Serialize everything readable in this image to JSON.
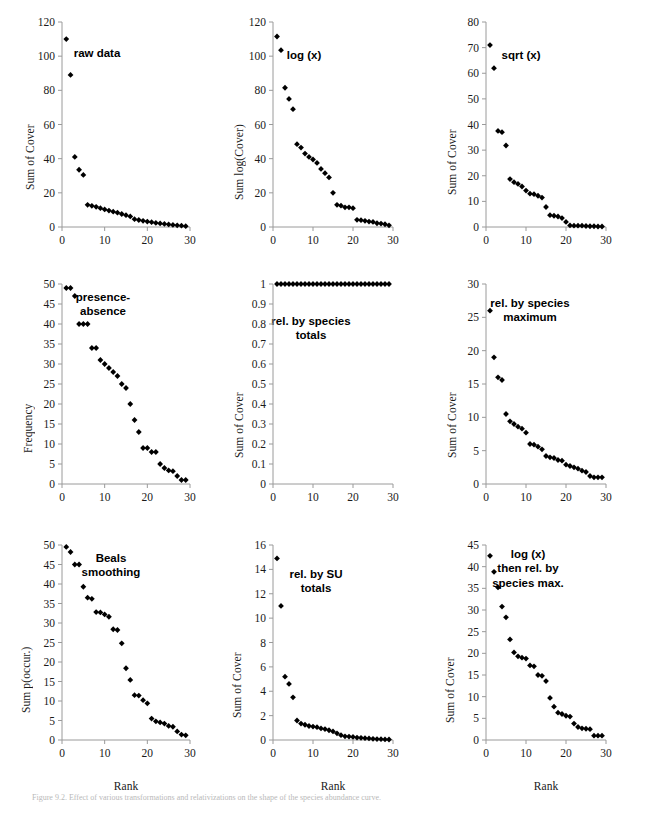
{
  "figure": {
    "caption": "Figure 9.2.  Effect of various transformations and relativizations on the shape of the species abundance curve.",
    "marker_color": "#000000",
    "axis_color": "#9a9a9a"
  },
  "chart_data": [
    {
      "id": "raw-data",
      "type": "scatter",
      "title": "raw data",
      "xlabel": "",
      "ylabel": "Sum of Cover",
      "xlim": [
        0,
        30
      ],
      "ylim": [
        0,
        120
      ],
      "xticks": [
        0,
        10,
        20,
        30
      ],
      "yticks": [
        0,
        20,
        40,
        60,
        80,
        100,
        120
      ],
      "grid": false,
      "x": [
        1,
        2,
        3,
        4,
        5,
        6,
        7,
        8,
        9,
        10,
        11,
        12,
        13,
        14,
        15,
        16,
        17,
        18,
        19,
        20,
        21,
        22,
        23,
        24,
        25,
        26,
        27,
        28,
        29
      ],
      "y": [
        110,
        89,
        41,
        33.5,
        30.5,
        13,
        12.4,
        11.8,
        11,
        10.3,
        9.6,
        9,
        8.4,
        7.6,
        6.9,
        6.2,
        4.6,
        4.1,
        3.6,
        3.2,
        2.8,
        2.4,
        2.1,
        1.8,
        1.5,
        1.2,
        1,
        0.8,
        0.5
      ]
    },
    {
      "id": "log-x",
      "type": "scatter",
      "title": "log (x)",
      "xlabel": "",
      "ylabel": "Sum log(Cover)",
      "xlim": [
        0,
        30
      ],
      "ylim": [
        0,
        120
      ],
      "xticks": [
        0,
        10,
        20,
        30
      ],
      "yticks": [
        0,
        20,
        40,
        60,
        80,
        100,
        120
      ],
      "grid": false,
      "x": [
        1,
        2,
        3,
        4,
        5,
        6,
        7,
        8,
        9,
        10,
        11,
        12,
        13,
        14,
        15,
        16,
        17,
        18,
        19,
        20,
        21,
        22,
        23,
        24,
        25,
        26,
        27,
        28,
        29
      ],
      "y": [
        111.5,
        103.5,
        81.5,
        75,
        69,
        48.5,
        46.5,
        43,
        41,
        39.5,
        37.5,
        34,
        31.5,
        29,
        20,
        13,
        12.5,
        11.5,
        11.5,
        11,
        4.2,
        4,
        3.6,
        3.2,
        3,
        2.2,
        2,
        1.6,
        1
      ]
    },
    {
      "id": "sqrt-x",
      "type": "scatter",
      "title": "sqrt (x)",
      "xlabel": "",
      "ylabel": "Sum of Cover",
      "xlim": [
        0,
        30
      ],
      "ylim": [
        0,
        80
      ],
      "xticks": [
        0,
        10,
        20,
        30
      ],
      "yticks": [
        0,
        10,
        20,
        30,
        40,
        50,
        60,
        70,
        80
      ],
      "grid": false,
      "x": [
        1,
        2,
        3,
        4,
        5,
        6,
        7,
        8,
        9,
        10,
        11,
        12,
        13,
        14,
        15,
        16,
        17,
        18,
        19,
        20,
        21,
        22,
        23,
        24,
        25,
        26,
        27,
        28,
        29
      ],
      "y": [
        71,
        62,
        37.5,
        37,
        31.8,
        18.7,
        17.5,
        16.8,
        15.8,
        14.2,
        13,
        12.8,
        12.2,
        11.5,
        7.8,
        4.6,
        4.4,
        4.1,
        3.5,
        2,
        0.6,
        0.5,
        0.5,
        0.5,
        0.4,
        0.3,
        0.3,
        0.2,
        0.2
      ]
    },
    {
      "id": "presence-absence",
      "type": "scatter",
      "title": "presence-\nabsence",
      "xlabel": "",
      "ylabel": "Frequency",
      "xlim": [
        0,
        30
      ],
      "ylim": [
        0,
        50
      ],
      "xticks": [
        0,
        10,
        20,
        30
      ],
      "yticks": [
        0,
        5,
        10,
        15,
        20,
        25,
        30,
        35,
        40,
        45,
        50
      ],
      "grid": false,
      "x": [
        1,
        2,
        3,
        4,
        5,
        6,
        7,
        8,
        9,
        10,
        11,
        12,
        13,
        14,
        15,
        16,
        17,
        18,
        19,
        20,
        21,
        22,
        23,
        24,
        25,
        26,
        27,
        28,
        29
      ],
      "y": [
        49,
        49,
        47,
        40,
        40,
        40,
        34,
        34,
        31,
        30,
        29,
        28,
        27,
        25,
        24,
        20,
        16,
        13,
        9,
        9,
        8,
        8,
        5,
        4,
        3.4,
        3.2,
        2,
        1,
        1
      ]
    },
    {
      "id": "rel-by-species-totals",
      "type": "scatter",
      "title": "rel. by species\ntotals",
      "xlabel": "",
      "ylabel": "Sum of Cover",
      "xlim": [
        0,
        30
      ],
      "ylim": [
        0,
        1
      ],
      "xticks": [
        0,
        10,
        20,
        30
      ],
      "yticks": [
        0,
        0.1,
        0.2,
        0.3,
        0.4,
        0.5,
        0.6,
        0.7,
        0.8,
        0.9,
        1
      ],
      "ytick_labels": [
        "0",
        "0.1",
        "0.2",
        "0.3",
        "0.4",
        "0.5",
        "0.6",
        "0.7",
        "0.8",
        "0.9",
        "1"
      ],
      "grid": false,
      "x": [
        1,
        2,
        3,
        4,
        5,
        6,
        7,
        8,
        9,
        10,
        11,
        12,
        13,
        14,
        15,
        16,
        17,
        18,
        19,
        20,
        21,
        22,
        23,
        24,
        25,
        26,
        27,
        28,
        29
      ],
      "y": [
        1,
        1,
        1,
        1,
        1,
        1,
        1,
        1,
        1,
        1,
        1,
        1,
        1,
        1,
        1,
        1,
        1,
        1,
        1,
        1,
        1,
        1,
        1,
        1,
        1,
        1,
        1,
        1,
        1
      ]
    },
    {
      "id": "rel-by-species-maximum",
      "type": "scatter",
      "title": "rel. by species\nmaximum",
      "xlabel": "",
      "ylabel": "Sum of Cover",
      "xlim": [
        0,
        30
      ],
      "ylim": [
        0,
        30
      ],
      "xticks": [
        0,
        10,
        20,
        30
      ],
      "yticks": [
        0,
        5,
        10,
        15,
        20,
        25,
        30
      ],
      "grid": false,
      "x": [
        1,
        2,
        3,
        4,
        5,
        6,
        7,
        8,
        9,
        10,
        11,
        12,
        13,
        14,
        15,
        16,
        17,
        18,
        19,
        20,
        21,
        22,
        23,
        24,
        25,
        26,
        27,
        28,
        29
      ],
      "y": [
        26,
        19,
        16,
        15.6,
        10.5,
        9.4,
        9,
        8.6,
        8.3,
        7.7,
        6,
        5.9,
        5.6,
        5.2,
        4.2,
        4,
        3.9,
        3.6,
        3.5,
        2.9,
        2.7,
        2.5,
        2.3,
        2,
        1.8,
        1.2,
        1,
        1,
        1
      ]
    },
    {
      "id": "beals-smoothing",
      "type": "scatter",
      "title": "Beals\nsmoothing",
      "xlabel": "Rank",
      "ylabel": "Sum p(occur.)",
      "xlim": [
        0,
        30
      ],
      "ylim": [
        0,
        50
      ],
      "xticks": [
        0,
        10,
        20,
        30
      ],
      "yticks": [
        0,
        5,
        10,
        15,
        20,
        25,
        30,
        35,
        40,
        45,
        50
      ],
      "grid": false,
      "x": [
        1,
        2,
        3,
        4,
        5,
        6,
        7,
        8,
        9,
        10,
        11,
        12,
        13,
        14,
        15,
        16,
        17,
        18,
        19,
        20,
        21,
        22,
        23,
        24,
        25,
        26,
        27,
        28,
        29
      ],
      "y": [
        49.5,
        48.2,
        45,
        45,
        39.3,
        36.5,
        36.2,
        32.8,
        32.7,
        32.2,
        31.6,
        28.4,
        28.2,
        24.8,
        18.4,
        15.4,
        11.5,
        11.4,
        10.2,
        9.4,
        5.5,
        4.8,
        4.5,
        4.2,
        3.6,
        3.4,
        2.2,
        1.4,
        1.2
      ]
    },
    {
      "id": "rel-by-su-totals",
      "type": "scatter",
      "title": "rel. by SU\ntotals",
      "xlabel": "Rank",
      "ylabel": "Sum of Cover",
      "xlim": [
        0,
        30
      ],
      "ylim": [
        0,
        16
      ],
      "xticks": [
        0,
        10,
        20,
        30
      ],
      "yticks": [
        0,
        2,
        4,
        6,
        8,
        10,
        12,
        14,
        16
      ],
      "grid": false,
      "x": [
        1,
        2,
        3,
        4,
        5,
        6,
        7,
        8,
        9,
        10,
        11,
        12,
        13,
        14,
        15,
        16,
        17,
        18,
        19,
        20,
        21,
        22,
        23,
        24,
        25,
        26,
        27,
        28,
        29
      ],
      "y": [
        14.9,
        11,
        5.2,
        4.6,
        3.5,
        1.6,
        1.35,
        1.25,
        1.15,
        1.1,
        1.05,
        0.95,
        0.9,
        0.8,
        0.7,
        0.55,
        0.4,
        0.3,
        0.28,
        0.25,
        0.2,
        0.18,
        0.15,
        0.13,
        0.1,
        0.08,
        0.07,
        0.05,
        0.04
      ]
    },
    {
      "id": "log-then-rel-by-species-max",
      "type": "scatter",
      "title": "log (x)\nthen rel. by\nspecies max.",
      "xlabel": "Rank",
      "ylabel": "Sum of Cover",
      "xlim": [
        0,
        30
      ],
      "ylim": [
        0,
        45
      ],
      "xticks": [
        0,
        10,
        20,
        30
      ],
      "yticks": [
        0,
        5,
        10,
        15,
        20,
        25,
        30,
        35,
        40,
        45
      ],
      "grid": false,
      "x": [
        1,
        2,
        3,
        4,
        5,
        6,
        7,
        8,
        9,
        10,
        11,
        12,
        13,
        14,
        15,
        16,
        17,
        18,
        19,
        20,
        21,
        22,
        23,
        24,
        25,
        26,
        27,
        28,
        29
      ],
      "y": [
        42.5,
        38.8,
        35.2,
        30.8,
        28.3,
        23.2,
        20.2,
        19.3,
        19,
        18.8,
        17.2,
        17,
        15,
        14.8,
        13.6,
        9.7,
        7.7,
        6.3,
        6,
        5.6,
        5.4,
        3.8,
        3,
        2.7,
        2.6,
        2.5,
        1,
        1,
        1
      ]
    }
  ]
}
